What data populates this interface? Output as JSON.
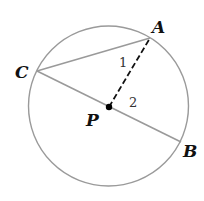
{
  "diagram": {
    "colors": {
      "circle": "#9a9a9a",
      "segment": "#9a9a9a",
      "dashed": "#111111",
      "center_dot": "#000000"
    },
    "circle": {
      "center": "P",
      "cx": 108.5,
      "cy": 106,
      "r": 80
    },
    "points": {
      "A": {
        "label": "A",
        "x": 150,
        "y": 38
      },
      "B": {
        "label": "B",
        "x": 181,
        "y": 142
      },
      "C": {
        "label": "C",
        "x": 37,
        "y": 71
      },
      "P": {
        "label": "P",
        "x": 109,
        "y": 107
      }
    },
    "segments": [
      {
        "from": "C",
        "to": "A",
        "style": "solid"
      },
      {
        "from": "C",
        "to": "B",
        "style": "solid"
      },
      {
        "from": "P",
        "to": "A",
        "style": "dashed"
      }
    ],
    "angle_labels": [
      {
        "label": "1",
        "x": 121,
        "y": 67
      },
      {
        "label": "2",
        "x": 131,
        "y": 107
      }
    ]
  }
}
